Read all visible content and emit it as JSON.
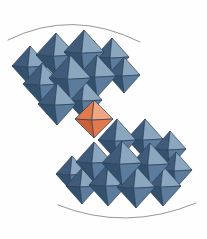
{
  "figure": {
    "description": "Two diagonal chains of blue coordination octahedra linked by a single orange octahedron at the centre, bounded above and below by thin grey arcs.",
    "background_color": "#fefefe",
    "width": 207,
    "height": 239
  },
  "palette": {
    "blue_dark": "#3f5b79",
    "blue_mid": "#5b7c9c",
    "blue_light": "#8ba6bf",
    "blue_pale": "#a7bccf",
    "blue_shadow": "#33506d",
    "orange_dark": "#c9603a",
    "orange_mid": "#e07a4e",
    "orange_light": "#f0a583",
    "edge_color": "#2b3f55",
    "arc_color": "#8b8b8b"
  },
  "arcs": [
    {
      "name": "top-arc",
      "path": "M 8 40 Q 72 8 140 42",
      "color": "#8b8b8b"
    },
    {
      "name": "bottom-arc",
      "path": "M 58 205 Q 126 232 196 203",
      "color": "#8b8b8b"
    }
  ],
  "chart_data": {
    "type": "diagram",
    "xlabel": "",
    "ylabel": "",
    "legend": [
      {
        "label": "Blue octahedron",
        "color": "#5b7c9c",
        "count": 22
      },
      {
        "label": "Orange octahedron",
        "color": "#e07a4e",
        "count": 1
      }
    ],
    "octahedra": [
      {
        "id": "b01",
        "cx": 30,
        "cy": 66,
        "rx": 18,
        "ry": 20,
        "type": "blue",
        "z": 1
      },
      {
        "id": "b02",
        "cx": 56,
        "cy": 55,
        "rx": 20,
        "ry": 22,
        "type": "blue",
        "z": 2
      },
      {
        "id": "b03",
        "cx": 84,
        "cy": 52,
        "rx": 20,
        "ry": 22,
        "type": "blue",
        "z": 2
      },
      {
        "id": "b04",
        "cx": 112,
        "cy": 57,
        "rx": 17,
        "ry": 19,
        "type": "blue",
        "z": 1
      },
      {
        "id": "b05",
        "cx": 42,
        "cy": 84,
        "rx": 19,
        "ry": 21,
        "type": "blue",
        "z": 3
      },
      {
        "id": "b06",
        "cx": 70,
        "cy": 78,
        "rx": 21,
        "ry": 23,
        "type": "blue",
        "z": 4
      },
      {
        "id": "b07",
        "cx": 97,
        "cy": 76,
        "rx": 19,
        "ry": 21,
        "type": "blue",
        "z": 3
      },
      {
        "id": "b08",
        "cx": 124,
        "cy": 75,
        "rx": 16,
        "ry": 18,
        "type": "blue",
        "z": 2
      },
      {
        "id": "b09",
        "cx": 57,
        "cy": 104,
        "rx": 19,
        "ry": 21,
        "type": "blue",
        "z": 4
      },
      {
        "id": "b10",
        "cx": 84,
        "cy": 100,
        "rx": 18,
        "ry": 20,
        "type": "blue",
        "z": 3
      },
      {
        "id": "o01",
        "cx": 94,
        "cy": 119,
        "rx": 19,
        "ry": 19,
        "type": "orange",
        "z": 6
      },
      {
        "id": "b11",
        "cx": 117,
        "cy": 140,
        "rx": 19,
        "ry": 21,
        "type": "blue",
        "z": 4
      },
      {
        "id": "b12",
        "cx": 145,
        "cy": 139,
        "rx": 18,
        "ry": 20,
        "type": "blue",
        "z": 3
      },
      {
        "id": "b13",
        "cx": 170,
        "cy": 149,
        "rx": 16,
        "ry": 18,
        "type": "blue",
        "z": 2
      },
      {
        "id": "b14",
        "cx": 94,
        "cy": 162,
        "rx": 18,
        "ry": 20,
        "type": "blue",
        "z": 4
      },
      {
        "id": "b15",
        "cx": 122,
        "cy": 163,
        "rx": 20,
        "ry": 22,
        "type": "blue",
        "z": 5
      },
      {
        "id": "b16",
        "cx": 150,
        "cy": 164,
        "rx": 19,
        "ry": 21,
        "type": "blue",
        "z": 4
      },
      {
        "id": "b17",
        "cx": 176,
        "cy": 170,
        "rx": 16,
        "ry": 18,
        "type": "blue",
        "z": 2
      },
      {
        "id": "b18",
        "cx": 72,
        "cy": 174,
        "rx": 16,
        "ry": 18,
        "type": "blue",
        "z": 2
      },
      {
        "id": "b19",
        "cx": 108,
        "cy": 185,
        "rx": 19,
        "ry": 21,
        "type": "blue",
        "z": 4
      },
      {
        "id": "b20",
        "cx": 136,
        "cy": 187,
        "rx": 19,
        "ry": 21,
        "type": "blue",
        "z": 4
      },
      {
        "id": "b21",
        "cx": 163,
        "cy": 186,
        "rx": 18,
        "ry": 20,
        "type": "blue",
        "z": 3
      },
      {
        "id": "b22",
        "cx": 82,
        "cy": 186,
        "rx": 16,
        "ry": 18,
        "type": "blue",
        "z": 2
      }
    ]
  }
}
